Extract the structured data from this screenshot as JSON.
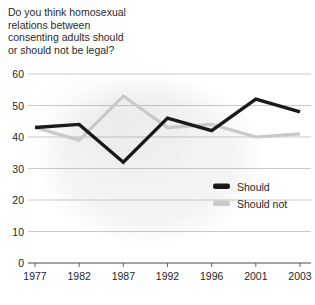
{
  "chart_data": {
    "type": "line",
    "title": "Do you think homosexual\nrelations between\nconsenting adults should\nor should not be legal?",
    "xlabel": "",
    "ylabel": "",
    "categories": [
      "1977",
      "1982",
      "1987",
      "1992",
      "1996",
      "2001",
      "2003"
    ],
    "x": [
      1977,
      1982,
      1987,
      1992,
      1996,
      2001,
      2003
    ],
    "ylim": [
      0,
      60
    ],
    "yticks": [
      0,
      10,
      20,
      30,
      40,
      50,
      60
    ],
    "ytick_labels": [
      "0",
      "10",
      "20",
      "30",
      "40",
      "50",
      "60"
    ],
    "grid": true,
    "grid_axis": "y",
    "legend_position": "inside-right",
    "series": [
      {
        "name": "Should",
        "color": "#1a1a1a",
        "values": [
          43,
          44,
          32,
          46,
          42,
          52,
          48
        ]
      },
      {
        "name": "Should not",
        "color": "#c9c9c9",
        "values": [
          43,
          39,
          53,
          43,
          44,
          40,
          41
        ]
      }
    ]
  },
  "legend": {
    "items": [
      {
        "label": "Should",
        "color": "#1a1a1a"
      },
      {
        "label": "Should not",
        "color": "#c9c9c9"
      }
    ]
  },
  "colors": {
    "should": "#1a1a1a",
    "should_not": "#c9c9c9",
    "grid": "#9a9a9a",
    "axis": "#555555",
    "background": "#ffffff",
    "text": "#1a1a1a"
  }
}
